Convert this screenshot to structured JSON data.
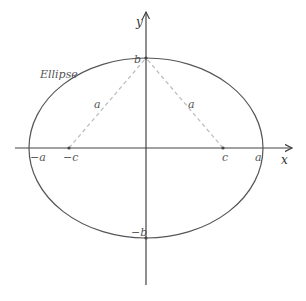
{
  "diagram": {
    "title": "Ellipse",
    "curve_label": "Ellipse",
    "axes": {
      "x_label": "x",
      "y_label": "y"
    },
    "parameters": {
      "a": 117,
      "b": 90,
      "c": 77
    },
    "points": {
      "neg_a": "−a",
      "neg_c": "−c",
      "c": "c",
      "a": "a",
      "b": "b",
      "neg_b": "−b"
    },
    "segment_labels": {
      "left": "a",
      "right": "a"
    },
    "colors": {
      "curve": "#555555",
      "axis": "#444444",
      "dashed": "#bbbbbb",
      "label": "#555555"
    }
  }
}
